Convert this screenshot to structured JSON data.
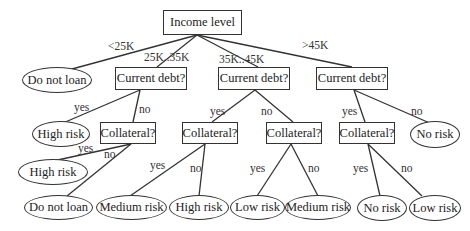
{
  "diagram": {
    "type": "decision-tree",
    "root": {
      "id": "income",
      "label": "Income level"
    },
    "nodes": [
      {
        "id": "income",
        "label": "Income level",
        "shape": "box"
      },
      {
        "id": "leaf_lt25",
        "label": "Do not loan",
        "shape": "ellipse"
      },
      {
        "id": "debt1",
        "label": "Current debt?",
        "shape": "box"
      },
      {
        "id": "debt2",
        "label": "Current debt?",
        "shape": "box"
      },
      {
        "id": "debt3",
        "label": "Current debt?",
        "shape": "box"
      },
      {
        "id": "leaf_d1_yes",
        "label": "High risk",
        "shape": "ellipse"
      },
      {
        "id": "coll1",
        "label": "Collateral?",
        "shape": "box"
      },
      {
        "id": "coll2",
        "label": "Collateral?",
        "shape": "box"
      },
      {
        "id": "coll3",
        "label": "Collateral?",
        "shape": "box"
      },
      {
        "id": "coll4",
        "label": "Collateral?",
        "shape": "box"
      },
      {
        "id": "leaf_d3_no",
        "label": "No risk",
        "shape": "ellipse"
      },
      {
        "id": "leaf_c1_yes",
        "label": "High risk",
        "shape": "ellipse"
      },
      {
        "id": "leaf_c1_no",
        "label": "Do not loan",
        "shape": "ellipse"
      },
      {
        "id": "leaf_c2_yes",
        "label": "Medium risk",
        "shape": "ellipse"
      },
      {
        "id": "leaf_c2_no",
        "label": "High risk",
        "shape": "ellipse"
      },
      {
        "id": "leaf_c3_yes",
        "label": "Low risk",
        "shape": "ellipse"
      },
      {
        "id": "leaf_c3_no",
        "label": "Medium risk",
        "shape": "ellipse"
      },
      {
        "id": "leaf_c4_yes",
        "label": "No risk",
        "shape": "ellipse"
      },
      {
        "id": "leaf_c4_no",
        "label": "Low risk",
        "shape": "ellipse"
      }
    ],
    "edges": [
      {
        "from": "income",
        "to": "leaf_lt25",
        "label": "<25K"
      },
      {
        "from": "income",
        "to": "debt1",
        "label": "25K..35K"
      },
      {
        "from": "income",
        "to": "debt2",
        "label": "35K..45K"
      },
      {
        "from": "income",
        "to": "debt3",
        "label": ">45K"
      },
      {
        "from": "debt1",
        "to": "leaf_d1_yes",
        "label": "yes"
      },
      {
        "from": "debt1",
        "to": "coll1",
        "label": "no"
      },
      {
        "from": "debt2",
        "to": "coll2",
        "label": "yes"
      },
      {
        "from": "debt2",
        "to": "coll3",
        "label": "no"
      },
      {
        "from": "debt3",
        "to": "coll4",
        "label": "yes"
      },
      {
        "from": "debt3",
        "to": "leaf_d3_no",
        "label": "no"
      },
      {
        "from": "coll1",
        "to": "leaf_c1_yes",
        "label": "yes"
      },
      {
        "from": "coll1",
        "to": "leaf_c1_no",
        "label": "no"
      },
      {
        "from": "coll2",
        "to": "leaf_c2_yes",
        "label": "yes"
      },
      {
        "from": "coll2",
        "to": "leaf_c2_no",
        "label": "no"
      },
      {
        "from": "coll3",
        "to": "leaf_c3_yes",
        "label": "yes"
      },
      {
        "from": "coll3",
        "to": "leaf_c3_no",
        "label": "no"
      },
      {
        "from": "coll4",
        "to": "leaf_c4_yes",
        "label": "yes"
      },
      {
        "from": "coll4",
        "to": "leaf_c4_no",
        "label": "no"
      }
    ]
  },
  "labels": {
    "income": "Income level",
    "leaf_lt25": "Do not loan",
    "debt1": "Current debt?",
    "debt2": "Current debt?",
    "debt3": "Current debt?",
    "leaf_d1_yes": "High risk",
    "coll1": "Collateral?",
    "coll2": "Collateral?",
    "coll3": "Collateral?",
    "coll4": "Collateral?",
    "leaf_d3_no": "No risk",
    "leaf_c1_yes": "High risk",
    "leaf_c1_no": "Do not loan",
    "leaf_c2_yes": "Medium risk",
    "leaf_c2_no": "High risk",
    "leaf_c3_yes": "Low risk",
    "leaf_c3_no": "Medium risk",
    "leaf_c4_yes": "No risk",
    "leaf_c4_no": "Low risk",
    "e_lt25": "<25K",
    "e_25_35": "25K..35K",
    "e_35_45": "35K..45K",
    "e_gt45": ">45K",
    "yes": "yes",
    "no": "no"
  },
  "colors": {
    "stroke": "#333333",
    "text": "#222222",
    "background": "#ffffff"
  }
}
